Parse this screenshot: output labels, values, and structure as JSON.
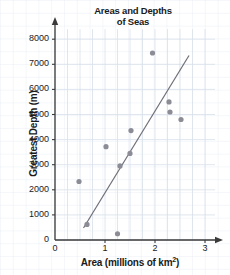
{
  "chart_data": {
    "type": "scatter",
    "title": "Areas and Depths of Seas",
    "title_line1": "Areas and Depths",
    "title_line2": "of Seas",
    "xlabel_prefix": "Area (millions of km",
    "xlabel_exponent": "2",
    "xlabel_suffix": ")",
    "ylabel": "Greatest Depth (m)",
    "xlim": [
      0,
      3.2
    ],
    "ylim": [
      0,
      8400
    ],
    "xticks": [
      "0",
      "1",
      "2",
      "3"
    ],
    "xtick_values": [
      0,
      1,
      2,
      3
    ],
    "yticks": [
      "0",
      "1000",
      "2000",
      "3000",
      "4000",
      "5000",
      "6000",
      "7000",
      "8000"
    ],
    "ytick_values": [
      0,
      1000,
      2000,
      3000,
      4000,
      5000,
      6000,
      7000,
      8000
    ],
    "grid": true,
    "legend": "none",
    "point_color": "#8c8c96",
    "line_color": "#6e6e78",
    "axis_color": "#3a3a3a",
    "grid_color": "#d8e0ea",
    "points": [
      {
        "x": 0.48,
        "y": 2330
      },
      {
        "x": 0.64,
        "y": 620
      },
      {
        "x": 1.02,
        "y": 3720
      },
      {
        "x": 1.25,
        "y": 250
      },
      {
        "x": 1.3,
        "y": 2950
      },
      {
        "x": 1.5,
        "y": 3450
      },
      {
        "x": 1.52,
        "y": 4360
      },
      {
        "x": 1.95,
        "y": 7450
      },
      {
        "x": 2.28,
        "y": 5500
      },
      {
        "x": 2.3,
        "y": 5100
      },
      {
        "x": 2.52,
        "y": 4800
      }
    ],
    "trend_line": {
      "x1": 0.57,
      "y1": 480,
      "x2": 2.68,
      "y2": 7350
    }
  }
}
